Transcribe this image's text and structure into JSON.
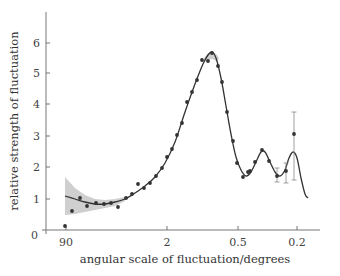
{
  "chart_data": {
    "type": "scatter",
    "title": "",
    "xlabel": "angular scale of fluctuation/degrees",
    "ylabel": "relative strength of fluctuation",
    "ylim": [
      0,
      7
    ],
    "y_ticks": [
      "0",
      "1",
      "2",
      "3",
      "4",
      "5",
      "6"
    ],
    "x_ticks": [
      "90",
      "2",
      "0.5",
      "0.2"
    ],
    "x_scale": "log (inverted)",
    "grid": false,
    "legend": null,
    "series": [
      {
        "name": "measurements",
        "style": "points",
        "points_px": [
          [
            65,
            226
          ],
          [
            72,
            211
          ],
          [
            80,
            198
          ],
          [
            87,
            206
          ],
          [
            96,
            203
          ],
          [
            104,
            204
          ],
          [
            111,
            203
          ],
          [
            118,
            207
          ],
          [
            126,
            198
          ],
          [
            132,
            194
          ],
          [
            138,
            184
          ],
          [
            144,
            188
          ],
          [
            150,
            183
          ],
          [
            156,
            176
          ],
          [
            162,
            168
          ],
          [
            167,
            157
          ],
          [
            172,
            149
          ],
          [
            177,
            135
          ],
          [
            182,
            123
          ],
          [
            187,
            102
          ],
          [
            192,
            92
          ],
          [
            197,
            80
          ],
          [
            202,
            60
          ],
          [
            208,
            61
          ],
          [
            212,
            53
          ],
          [
            218,
            66
          ],
          [
            222,
            82
          ],
          [
            227,
            112
          ],
          [
            233,
            141
          ],
          [
            237,
            163
          ],
          [
            243,
            177
          ],
          [
            248,
            172
          ],
          [
            250,
            171
          ],
          [
            255,
            162
          ],
          [
            262,
            150
          ],
          [
            269,
            161
          ],
          [
            277,
            176
          ],
          [
            286,
            171
          ],
          [
            294,
            134
          ]
        ],
        "values": [
          0.13,
          0.61,
          1.03,
          0.77,
          0.87,
          0.83,
          0.87,
          0.74,
          1.03,
          1.15,
          1.47,
          1.35,
          1.51,
          1.73,
          1.99,
          2.34,
          2.6,
          3.04,
          3.43,
          4.1,
          4.42,
          4.81,
          5.45,
          5.42,
          5.67,
          5.26,
          4.74,
          3.78,
          2.85,
          2.15,
          1.7,
          1.86,
          1.89,
          2.18,
          2.56,
          2.21,
          1.73,
          1.89,
          3.08
        ],
        "error_bars_px": [
          {
            "x": 277,
            "y_top": 168,
            "y_bottom": 182
          },
          {
            "x": 286,
            "y_top": 163,
            "y_bottom": 183
          },
          {
            "x": 294,
            "y_top": 112,
            "y_bottom": 180
          }
        ]
      },
      {
        "name": "model fit",
        "style": "line",
        "curve_px": [
          [
            65,
            196
          ],
          [
            75,
            199
          ],
          [
            85,
            202
          ],
          [
            95,
            204
          ],
          [
            105,
            204
          ],
          [
            115,
            202
          ],
          [
            125,
            199
          ],
          [
            135,
            193
          ],
          [
            145,
            186
          ],
          [
            155,
            177
          ],
          [
            165,
            163
          ],
          [
            175,
            142
          ],
          [
            185,
            112
          ],
          [
            195,
            84
          ],
          [
            203,
            64
          ],
          [
            208,
            55
          ],
          [
            212,
            52
          ],
          [
            216,
            58
          ],
          [
            221,
            78
          ],
          [
            226,
            106
          ],
          [
            231,
            134
          ],
          [
            236,
            157
          ],
          [
            241,
            170
          ],
          [
            246,
            176
          ],
          [
            251,
            172
          ],
          [
            256,
            162
          ],
          [
            261,
            152
          ],
          [
            265,
            152
          ],
          [
            270,
            162
          ],
          [
            275,
            172
          ],
          [
            280,
            176
          ],
          [
            285,
            170
          ],
          [
            289,
            158
          ],
          [
            293,
            152
          ],
          [
            297,
            158
          ],
          [
            301,
            178
          ],
          [
            305,
            194
          ],
          [
            308,
            198
          ]
        ]
      },
      {
        "name": "uncertainty band",
        "style": "area",
        "color": "#cfcfcf",
        "upper_px": [
          [
            65,
            177
          ],
          [
            75,
            188
          ],
          [
            85,
            195
          ],
          [
            95,
            199
          ],
          [
            105,
            200
          ],
          [
            115,
            199
          ],
          [
            125,
            197
          ]
        ],
        "lower_px": [
          [
            125,
            201
          ],
          [
            115,
            206
          ],
          [
            105,
            208
          ],
          [
            95,
            210
          ],
          [
            85,
            212
          ],
          [
            75,
            214
          ],
          [
            65,
            215
          ]
        ]
      }
    ]
  },
  "colors": {
    "axis": "#777777",
    "points": "#333333",
    "line": "#333333",
    "band": "#cfcfcf"
  }
}
